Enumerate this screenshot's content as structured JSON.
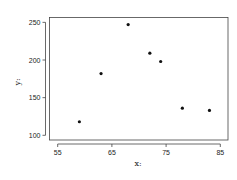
{
  "chart_data": {
    "type": "scatter",
    "title": "",
    "xlabel": "x:",
    "ylabel": "y:",
    "xlim": [
      53.5,
      86.5
    ],
    "ylim": [
      94,
      257
    ],
    "x_ticks": [
      55,
      65,
      75,
      85
    ],
    "y_ticks": [
      100,
      150,
      200,
      250
    ],
    "grid": false,
    "legend": null,
    "points": [
      {
        "x": 59,
        "y": 118
      },
      {
        "x": 63,
        "y": 182
      },
      {
        "x": 68,
        "y": 247
      },
      {
        "x": 72,
        "y": 209
      },
      {
        "x": 74,
        "y": 198
      },
      {
        "x": 78,
        "y": 136
      },
      {
        "x": 83,
        "y": 133
      }
    ],
    "marker_color": "#111111"
  }
}
